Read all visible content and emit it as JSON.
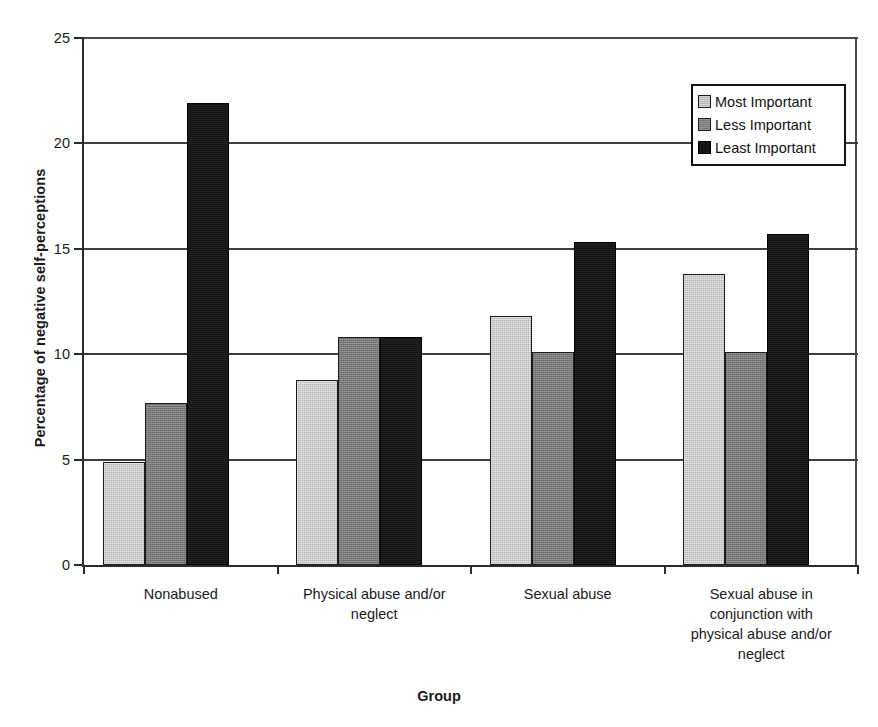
{
  "chart_data": {
    "type": "bar",
    "title": "",
    "xlabel": "Group",
    "ylabel": "Percentage of negative self-perceptions",
    "ylim": [
      0,
      25
    ],
    "yticks": [
      0,
      5,
      10,
      15,
      20,
      25
    ],
    "ytick_labels": [
      "0",
      "5",
      "10",
      "15",
      "20",
      "25"
    ],
    "grid": true,
    "legend_position": "top-right",
    "categories": [
      "Nonabused",
      "Physical abuse and/or neglect",
      "Sexual abuse",
      "Sexual abuse in conjunction with physical abuse and/or neglect"
    ],
    "category_lines": [
      [
        "Nonabused"
      ],
      [
        "Physical abuse and/or",
        "neglect"
      ],
      [
        "Sexual abuse"
      ],
      [
        "Sexual abuse in",
        "conjunction with",
        "physical abuse and/or",
        "neglect"
      ]
    ],
    "series": [
      {
        "name": "Most Important",
        "color": "#b6b6b6",
        "values": [
          4.9,
          8.8,
          11.8,
          13.8
        ]
      },
      {
        "name": "Less Important",
        "color": "#777777",
        "values": [
          7.7,
          10.8,
          10.1,
          10.1
        ]
      },
      {
        "name": "Least Important",
        "color": "#151515",
        "values": [
          21.9,
          10.8,
          15.3,
          15.7
        ]
      }
    ]
  },
  "legend": {
    "items": [
      {
        "label": "Most Important"
      },
      {
        "label": "Less Important"
      },
      {
        "label": "Least Important"
      }
    ]
  },
  "artifact": {
    "top_crop_text": "........."
  }
}
